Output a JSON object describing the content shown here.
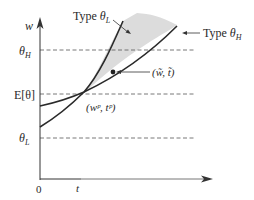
{
  "diagram": {
    "axes": {
      "y_label": "w",
      "x_label": "t",
      "origin_label": "0"
    },
    "y_ticks": [
      {
        "key": "theta_h",
        "base": "θ",
        "sub": "H"
      },
      {
        "key": "e_theta",
        "text": "E[θ]"
      },
      {
        "key": "theta_l",
        "base": "θ",
        "sub": "L"
      }
    ],
    "curves": [
      {
        "key": "type_l",
        "label_prefix": "Type ",
        "base": "θ",
        "sub": "L"
      },
      {
        "key": "type_h",
        "label_prefix": "Type ",
        "base": "θ",
        "sub": "H"
      }
    ],
    "points": {
      "pooling": {
        "label": "(wᵖ, tᵖ)"
      },
      "deviation": {
        "label": "(w̃, t̃)"
      }
    },
    "colors": {
      "line": "#2a2a2a",
      "shade": "#dcdcdc",
      "dash": "#555555",
      "axis": "#333333"
    }
  }
}
